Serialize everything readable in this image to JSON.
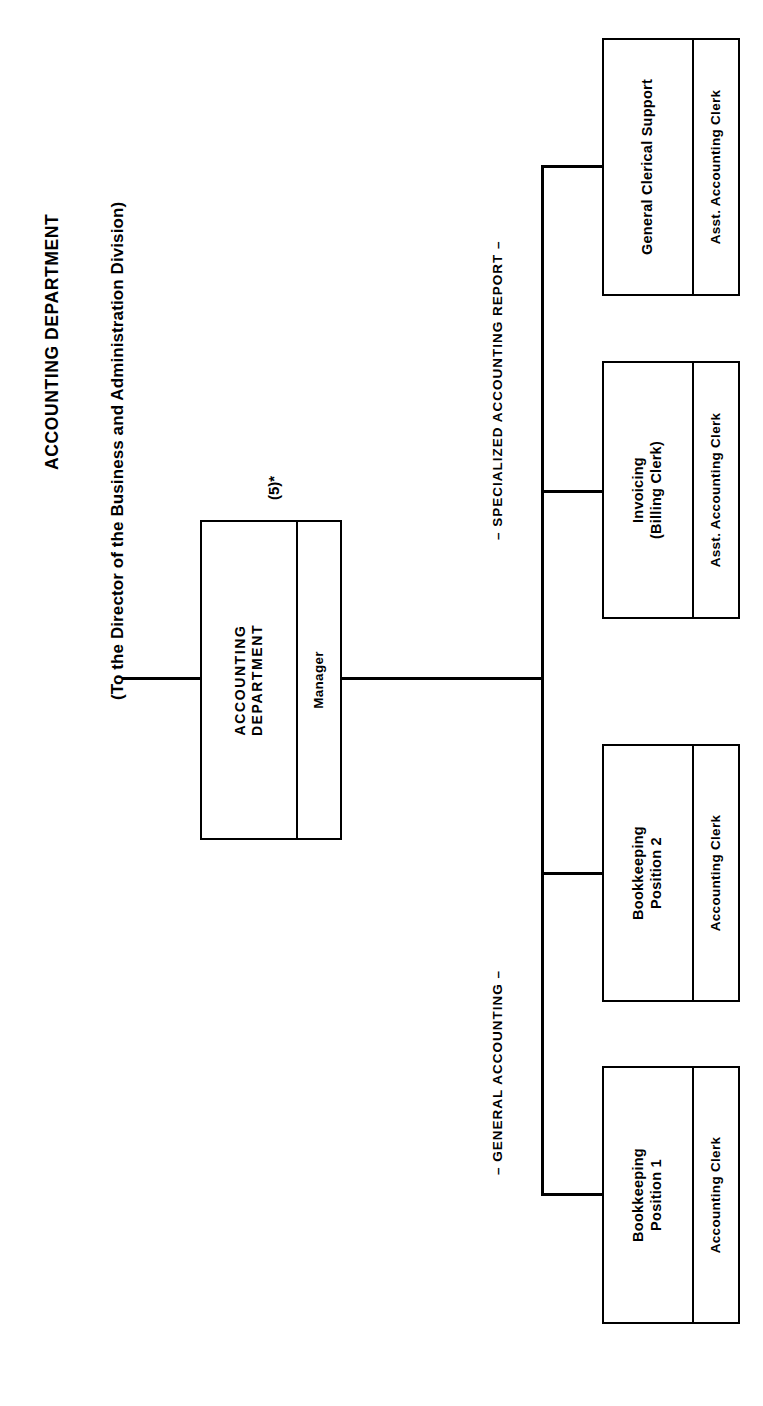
{
  "page": {
    "title": "ACCOUNTING DEPARTMENT",
    "subtitle": "(To the Director of the Business and Administration Division)",
    "background_color": "#ffffff",
    "line_color": "#000000"
  },
  "root": {
    "title_line1": "ACCOUNTING",
    "title_line2": "DEPARTMENT",
    "role": "Manager",
    "annotation": "(5)*"
  },
  "groups": [
    {
      "id": "specialized",
      "label": "– SPECIALIZED ACCOUNTING REPORT –"
    },
    {
      "id": "general",
      "label": "– GENERAL ACCOUNTING –"
    }
  ],
  "nodes": [
    {
      "id": "general-clerical-support",
      "title_line1": "General Clerical Support",
      "title_line2": "",
      "role": "Asst. Accounting Clerk",
      "group": "specialized"
    },
    {
      "id": "invoicing",
      "title_line1": "Invoicing",
      "title_line2": "(Billing Clerk)",
      "role": "Asst. Accounting Clerk",
      "group": "specialized"
    },
    {
      "id": "bookkeeping-position-2",
      "title_line1": "Bookkeeping",
      "title_line2": "Position 2",
      "role": "Accounting Clerk",
      "group": "general"
    },
    {
      "id": "bookkeeping-position-1",
      "title_line1": "Bookkeeping",
      "title_line2": "Position 1",
      "role": "Accounting Clerk",
      "group": "general"
    }
  ]
}
